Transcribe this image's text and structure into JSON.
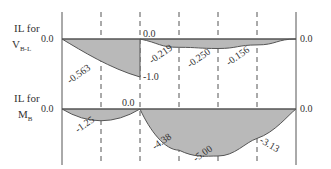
{
  "colors": {
    "fill": "#b9b9b9",
    "line": "#555555",
    "text": "#333333"
  },
  "diagrams": [
    {
      "id": "il-vbl",
      "label_line1": "IL for",
      "label_main": "V",
      "label_sub": "B-L",
      "start_value": "0.0",
      "mid_value_top": "0.0",
      "end_value": "0.0",
      "jump_value": "-1.0",
      "ordinates": [
        0,
        -0.563,
        -1.0,
        0,
        -0.219,
        -0.25,
        -0.156,
        0
      ],
      "point_labels": [
        {
          "text": "-0.563",
          "at": 1
        },
        {
          "text": "-0.219",
          "at": 3
        },
        {
          "text": "-0.250",
          "at": 4
        },
        {
          "text": "-0.156",
          "at": 5
        }
      ]
    },
    {
      "id": "il-mb",
      "label_line1": "IL for",
      "label_main": "M",
      "label_sub": "B",
      "start_value": "0.0",
      "mid_value_top": "0.0",
      "end_value": "0.0",
      "ordinates": [
        0,
        -1.25,
        0,
        -4.38,
        -5.0,
        -3.13,
        0
      ],
      "point_labels": [
        {
          "text": "-1.25",
          "at": 1
        },
        {
          "text": "-4.38",
          "at": 3
        },
        {
          "text": "-5.00",
          "at": 4
        },
        {
          "text": "-3.13",
          "at": 5
        }
      ]
    }
  ]
}
